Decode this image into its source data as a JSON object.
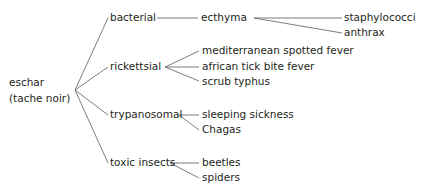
{
  "diagram": {
    "type": "tree",
    "root": {
      "label_line1": "eschar",
      "label_line2": "(tache noir)"
    },
    "categories": [
      {
        "label": "bacterial",
        "children": [
          {
            "label": "ecthyma",
            "children": [
              {
                "label": "staphylococci"
              },
              {
                "label": "anthrax"
              }
            ]
          }
        ]
      },
      {
        "label": "rickettsial",
        "children": [
          {
            "label": "mediterranean spotted fever"
          },
          {
            "label": "african tick bite fever"
          },
          {
            "label": "scrub typhus"
          }
        ]
      },
      {
        "label": "trypanosomal",
        "children": [
          {
            "label": "sleeping sickness"
          },
          {
            "label": "Chagas"
          }
        ]
      },
      {
        "label": "toxic insects",
        "children": [
          {
            "label": "beetles"
          },
          {
            "label": "spiders"
          }
        ]
      }
    ]
  },
  "colors": {
    "text": "#231f20",
    "lines": "#6d6e71",
    "background": "#ffffff"
  }
}
